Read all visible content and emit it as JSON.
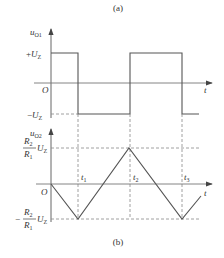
{
  "figure": {
    "panel_a": {
      "caption": "(a)",
      "y_label_main": "u",
      "y_label_sub": "O1",
      "x_label": "t",
      "origin": "O",
      "upper_level": {
        "sign": "+",
        "main": "U",
        "sub": "Z"
      },
      "lower_level": {
        "sign": "−",
        "main": "U",
        "sub": "Z"
      }
    },
    "panel_b": {
      "caption": "(b)",
      "y_label_main": "u",
      "y_label_sub": "O2",
      "x_label": "t",
      "origin": "O",
      "upper_level": {
        "num_main": "R",
        "num_sub": "2",
        "den_main": "R",
        "den_sub": "1",
        "main": "U",
        "sub": "Z"
      },
      "lower_level": {
        "sign": "−",
        "num_main": "R",
        "num_sub": "2",
        "den_main": "R",
        "den_sub": "1",
        "main": "U",
        "sub": "Z"
      },
      "ticks": [
        {
          "main": "t",
          "sub": "1"
        },
        {
          "main": "t",
          "sub": "2"
        },
        {
          "main": "t",
          "sub": "3"
        }
      ]
    },
    "colors": {
      "line": "#555555",
      "dash": "#888888",
      "text": "#333333"
    }
  }
}
